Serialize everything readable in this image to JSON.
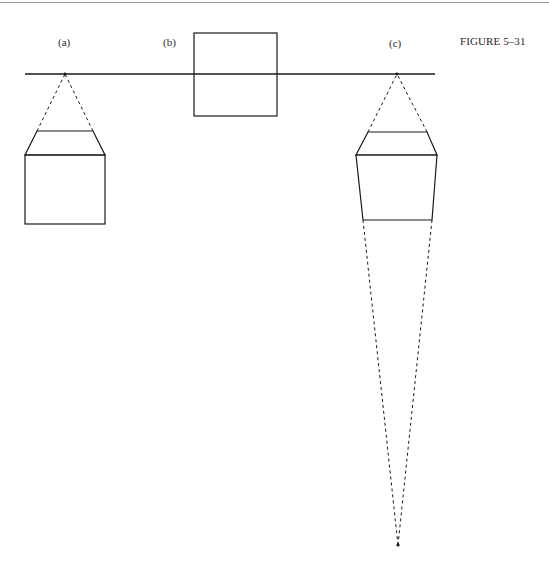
{
  "figure": {
    "title": "FIGURE 5–31",
    "panels": [
      {
        "id": "a",
        "label": "(a)"
      },
      {
        "id": "b",
        "label": "(b)"
      },
      {
        "id": "c",
        "label": "(c)"
      }
    ]
  },
  "colors": {
    "ink": "#1a1a1a",
    "page_rule": "#9a9a9a"
  }
}
